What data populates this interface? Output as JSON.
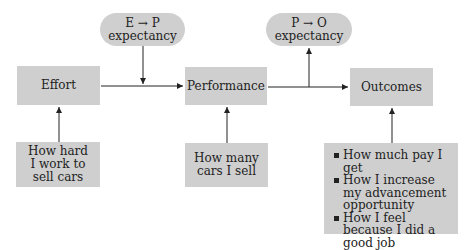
{
  "diagram": {
    "nodes": {
      "effort": {
        "label": "Effort"
      },
      "performance": {
        "label": "Performance"
      },
      "outcomes": {
        "label": "Outcomes"
      },
      "ep_expectancy": {
        "line1": "E → P",
        "line2": "expectancy"
      },
      "po_expectancy": {
        "line1": "P → O",
        "line2": "expectancy"
      },
      "effort_example": {
        "label": "How hard I work to sell cars"
      },
      "performance_example": {
        "label": "How many cars I sell"
      },
      "outcomes_examples": {
        "items": [
          "How much pay I get",
          "How I increase my advancement opportunity",
          "How I feel because I did a good job"
        ]
      }
    },
    "edges": [
      {
        "from": "effort",
        "to": "performance"
      },
      {
        "from": "performance",
        "to": "outcomes"
      },
      {
        "from": "ep_expectancy",
        "to": "effort-performance-line"
      },
      {
        "from": "performance-outcomes-line",
        "to": "po_expectancy"
      },
      {
        "from": "effort_example",
        "to": "effort"
      },
      {
        "from": "performance_example",
        "to": "performance"
      },
      {
        "from": "outcomes_examples",
        "to": "outcomes"
      }
    ],
    "colors": {
      "box_fill": "#cfcfcf",
      "line": "#222222",
      "background": "#ffffff"
    }
  }
}
